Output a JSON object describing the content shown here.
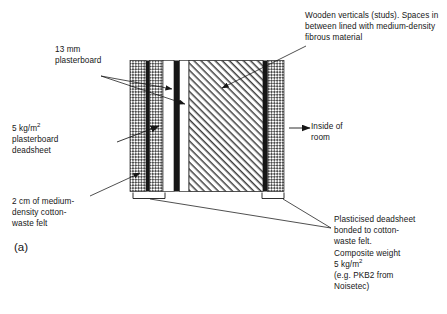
{
  "figure": {
    "id_label": "(a)",
    "type": "cross-section-construction-diagram",
    "background": "#ffffff",
    "ink": "#161616"
  },
  "labels": {
    "studs": "Wooden verticals (studs). Spaces in between lined with medium-density fibrous material",
    "plasterboard_13mm": "13 mm\nplasterboard",
    "deadsheet_5kg_line1": "5 kg/m",
    "deadsheet_5kg_exp": "2",
    "deadsheet_5kg_rest": "\nplasterboard\ndeadsheet",
    "felt_2cm": "2 cm of medium-\ndensity cotton-\nwaste felt",
    "inside_of_room": "Inside of\nroom",
    "plasticised_line1": "Plasticised deadsheet",
    "plasticised_line2": "bonded to cotton-",
    "plasticised_line3": "waste felt.",
    "plasticised_line4": "Composite weight",
    "plasticised_line5": "5 kg/m",
    "plasticised_line5_exp": "2",
    "plasticised_line6": "(e.g. PKB2 from",
    "plasticised_line7": "Noisetec)"
  },
  "layers": [
    {
      "name": "cotton-waste-felt-outer",
      "fill": "stipple",
      "x": 130,
      "width": 16
    },
    {
      "name": "plasticised-deadsheet-outer",
      "fill": "solid-dark",
      "x": 146,
      "width": 4
    },
    {
      "name": "cotton-waste-felt-inner",
      "fill": "stipple",
      "x": 150,
      "width": 13
    },
    {
      "name": "air-gap-left",
      "fill": "white",
      "x": 163,
      "width": 11
    },
    {
      "name": "plasterboard-deadsheet",
      "fill": "solid-dark",
      "x": 174,
      "width": 6
    },
    {
      "name": "plasterboard-13mm",
      "fill": "white",
      "x": 180,
      "width": 9
    },
    {
      "name": "stud-cavity-fibrous",
      "fill": "diagonal-hatch",
      "x": 189,
      "width": 74
    },
    {
      "name": "deadsheet-inner",
      "fill": "solid-dark",
      "x": 263,
      "width": 5
    },
    {
      "name": "cotton-waste-felt-room-side",
      "fill": "stipple",
      "x": 268,
      "width": 16
    }
  ],
  "geometry": {
    "wall_top_y": 60,
    "wall_bottom_y": 192,
    "bracket_left_x": 133,
    "bracket_left_width": 32,
    "bracket_right_x": 262,
    "bracket_right_width": 22
  },
  "colors": {
    "ink": "#161616",
    "hatch": "#4a4a4a",
    "stipple": "#555555",
    "paper": "#ffffff"
  }
}
